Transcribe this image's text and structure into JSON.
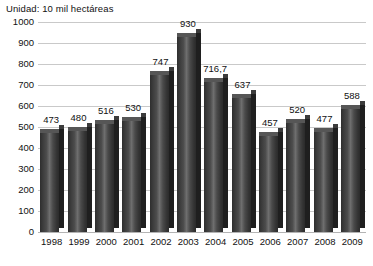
{
  "chart_data": {
    "type": "bar",
    "title": "Unidad: 10 mil hectáreas",
    "subtitle": "",
    "xlabel": "",
    "ylabel": "",
    "ylim": [
      0,
      1000
    ],
    "ytick_step": 100,
    "yticks": [
      "1000",
      "900",
      "800",
      "700",
      "600",
      "500",
      "400",
      "300",
      "200",
      "100",
      "0"
    ],
    "grid": true,
    "legend": false,
    "categories": [
      "1998",
      "1999",
      "2000",
      "2001",
      "2002",
      "2003",
      "2004",
      "2005",
      "2006",
      "2007",
      "2008",
      "2009"
    ],
    "values": [
      473,
      480,
      516,
      530,
      747,
      930,
      716.7,
      637,
      457,
      520,
      477,
      588
    ],
    "value_labels": [
      "473",
      "480",
      "516",
      "530",
      "747",
      "930",
      "716,7",
      "637",
      "457",
      "520",
      "477",
      "588"
    ],
    "bar_color": "#3d3d3d",
    "grid_color": "#c9c9c9",
    "text_color": "#111111",
    "background_color": "#ffffff"
  }
}
